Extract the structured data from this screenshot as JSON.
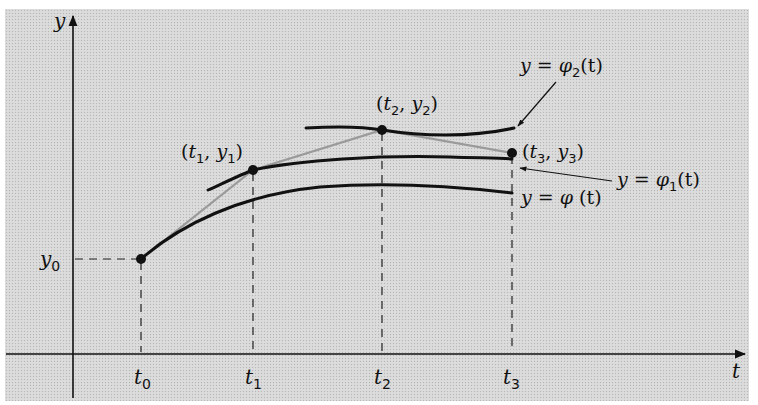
{
  "figure": {
    "background": "#d9d9d9",
    "ink": "#111111",
    "polygon_color": "#9a9a9a"
  },
  "axes": {
    "y_label": "y",
    "t_label": "t",
    "y0_label": "y",
    "y0_sub": "0"
  },
  "ticks": [
    {
      "name": "t",
      "sub": "0"
    },
    {
      "name": "t",
      "sub": "1"
    },
    {
      "name": "t",
      "sub": "2"
    },
    {
      "name": "t",
      "sub": "3"
    }
  ],
  "points": [
    {
      "label_t": "t",
      "label_y": "y",
      "sub": "1"
    },
    {
      "label_t": "t",
      "label_y": "y",
      "sub": "2"
    },
    {
      "label_t": "t",
      "label_y": "y",
      "sub": "3"
    }
  ],
  "curves": {
    "phi": {
      "lhs": "y",
      "eq": " = ",
      "fn": "φ",
      "sub": "",
      "arg": " (t)"
    },
    "phi1": {
      "lhs": "y",
      "eq": " = ",
      "fn": "φ",
      "sub": "1",
      "arg": "(t)"
    },
    "phi2": {
      "lhs": "y",
      "eq": " = ",
      "fn": "φ",
      "sub": "2",
      "arg": "(t)"
    }
  },
  "punct": {
    "open": "(",
    "comma": ", ",
    "close": ")"
  }
}
